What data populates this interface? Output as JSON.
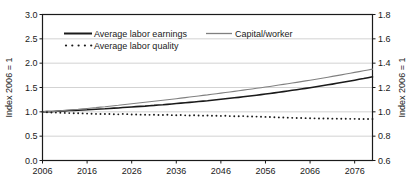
{
  "chart_data": {
    "type": "line",
    "title": "",
    "xlabel": "",
    "ylabel": "Index 2006 = 1",
    "ylabel_right": "Index 2006 = 1",
    "xlim": [
      2006,
      2080
    ],
    "ylim": [
      0.0,
      3.0
    ],
    "ylim_right": [
      0.6,
      1.8
    ],
    "xticks": [
      2006,
      2016,
      2026,
      2036,
      2046,
      2056,
      2066,
      2076
    ],
    "yticks": [
      "0.0",
      "0.5",
      "1.0",
      "1.5",
      "2.0",
      "2.5",
      "3.0"
    ],
    "yticks_right": [
      "0.6",
      "0.8",
      "1.0",
      "1.2",
      "1.4",
      "1.6",
      "1.8"
    ],
    "grid": true,
    "legend_position": "top-center",
    "legend": [
      {
        "name": "Average labor earnings",
        "style": "solid",
        "color": "#1a1a1a",
        "width": 1.6
      },
      {
        "name": "Capital/worker",
        "style": "solid",
        "color": "#808080",
        "width": 1.1
      },
      {
        "name": "Average labor quality",
        "style": "dotted",
        "color": "#1a1a1a",
        "width": 1.6
      }
    ],
    "x": [
      2006,
      2007,
      2008,
      2009,
      2010,
      2011,
      2012,
      2013,
      2014,
      2015,
      2016,
      2017,
      2018,
      2019,
      2020,
      2021,
      2022,
      2023,
      2024,
      2025,
      2026,
      2027,
      2028,
      2029,
      2030,
      2031,
      2032,
      2033,
      2034,
      2035,
      2036,
      2037,
      2038,
      2039,
      2040,
      2041,
      2042,
      2043,
      2044,
      2045,
      2046,
      2047,
      2048,
      2049,
      2050,
      2051,
      2052,
      2053,
      2054,
      2055,
      2056,
      2057,
      2058,
      2059,
      2060,
      2061,
      2062,
      2063,
      2064,
      2065,
      2066,
      2067,
      2068,
      2069,
      2070,
      2071,
      2072,
      2073,
      2074,
      2075,
      2076,
      2077,
      2078,
      2079,
      2080
    ],
    "series": [
      {
        "name": "Average labor earnings",
        "axis": "left",
        "values": [
          1.0,
          1.005,
          1.002,
          1.012,
          1.018,
          1.02,
          1.026,
          1.03,
          1.032,
          1.038,
          1.042,
          1.048,
          1.052,
          1.058,
          1.062,
          1.07,
          1.076,
          1.08,
          1.088,
          1.094,
          1.1,
          1.106,
          1.112,
          1.118,
          1.126,
          1.132,
          1.14,
          1.146,
          1.154,
          1.162,
          1.17,
          1.178,
          1.186,
          1.194,
          1.202,
          1.212,
          1.22,
          1.228,
          1.238,
          1.248,
          1.258,
          1.268,
          1.278,
          1.288,
          1.298,
          1.31,
          1.32,
          1.33,
          1.342,
          1.354,
          1.366,
          1.378,
          1.39,
          1.402,
          1.416,
          1.428,
          1.442,
          1.454,
          1.468,
          1.482,
          1.496,
          1.51,
          1.526,
          1.54,
          1.556,
          1.57,
          1.586,
          1.602,
          1.618,
          1.634,
          1.65,
          1.668,
          1.684,
          1.702,
          1.72
        ]
      },
      {
        "name": "Capital/worker",
        "axis": "left",
        "values": [
          1.0,
          1.01,
          1.014,
          1.01,
          1.022,
          1.03,
          1.038,
          1.046,
          1.052,
          1.06,
          1.068,
          1.078,
          1.086,
          1.096,
          1.104,
          1.116,
          1.126,
          1.134,
          1.146,
          1.156,
          1.166,
          1.176,
          1.186,
          1.196,
          1.206,
          1.216,
          1.228,
          1.238,
          1.248,
          1.26,
          1.27,
          1.282,
          1.292,
          1.304,
          1.314,
          1.326,
          1.338,
          1.348,
          1.36,
          1.372,
          1.384,
          1.396,
          1.408,
          1.42,
          1.432,
          1.446,
          1.458,
          1.47,
          1.484,
          1.496,
          1.51,
          1.522,
          1.536,
          1.55,
          1.564,
          1.578,
          1.592,
          1.606,
          1.62,
          1.636,
          1.65,
          1.666,
          1.68,
          1.696,
          1.712,
          1.728,
          1.744,
          1.76,
          1.776,
          1.792,
          1.81,
          1.826,
          1.844,
          1.86,
          1.878
        ]
      },
      {
        "name": "Average labor quality",
        "axis": "left",
        "values": [
          1.0,
          0.992,
          0.986,
          0.984,
          0.98,
          0.978,
          0.974,
          0.972,
          0.97,
          0.968,
          0.964,
          0.962,
          0.958,
          0.956,
          0.954,
          0.956,
          0.95,
          0.948,
          0.958,
          0.952,
          0.946,
          0.944,
          0.942,
          0.94,
          0.938,
          0.94,
          0.936,
          0.934,
          0.94,
          0.932,
          0.93,
          0.934,
          0.928,
          0.926,
          0.93,
          0.924,
          0.922,
          0.926,
          0.92,
          0.918,
          0.916,
          0.918,
          0.912,
          0.91,
          0.908,
          0.912,
          0.906,
          0.904,
          0.902,
          0.9,
          0.896,
          0.894,
          0.89,
          0.886,
          0.884,
          0.88,
          0.876,
          0.874,
          0.872,
          0.87,
          0.868,
          0.866,
          0.864,
          0.862,
          0.862,
          0.86,
          0.86,
          0.858,
          0.858,
          0.856,
          0.856,
          0.854,
          0.854,
          0.852,
          0.852
        ]
      }
    ]
  },
  "colors": {
    "frame": "#1a1a1a",
    "grid": "#c8c8c8",
    "text": "#1a1a1a",
    "series_dark": "#1a1a1a",
    "series_gray": "#808080",
    "background": "#ffffff"
  }
}
